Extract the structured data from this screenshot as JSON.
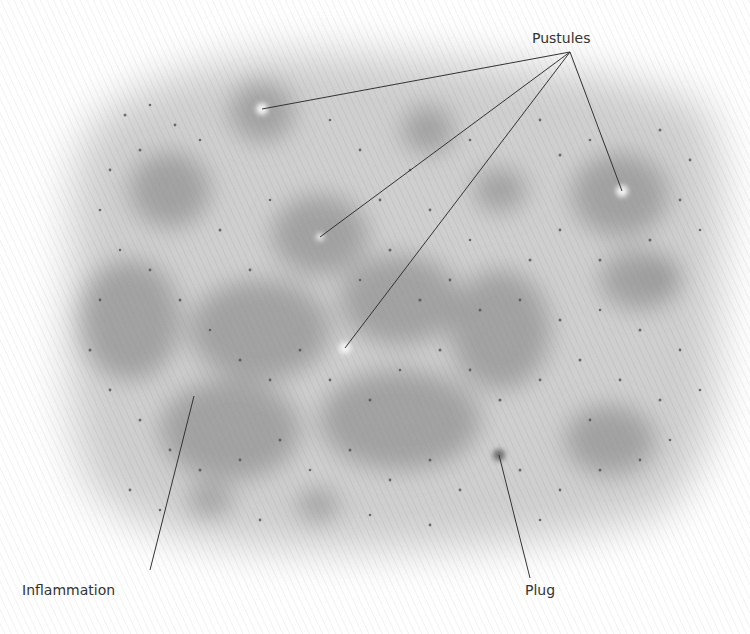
{
  "figure": {
    "colors": {
      "background": "#ffffff",
      "skin_base": "#cfcfcf",
      "inflamed_patch": "#8a8a8a",
      "pore_dots": "#4a4a4a",
      "pustule_head": "#f4f4f4",
      "leader_line": "#333333",
      "label_text": "#333333"
    },
    "labels": {
      "pustules": "Pustules",
      "inflammation": "Inflammation",
      "plug": "Plug"
    },
    "pustules": [
      {
        "x": 262,
        "y": 109
      },
      {
        "x": 320,
        "y": 237
      },
      {
        "x": 345,
        "y": 348
      },
      {
        "x": 622,
        "y": 191
      }
    ],
    "pustules_anchor": {
      "x": 570,
      "y": 52
    },
    "inflammation_leader": {
      "x1": 194,
      "y1": 396,
      "x2": 150,
      "y2": 570
    },
    "plug_leader": {
      "x1": 499,
      "y1": 455,
      "x2": 530,
      "y2": 578
    }
  }
}
